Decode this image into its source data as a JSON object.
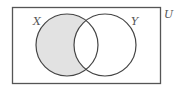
{
  "diagram": {
    "type": "venn",
    "universe_label": "U",
    "sets": [
      {
        "id": "X",
        "label": "X"
      },
      {
        "id": "Y",
        "label": "Y"
      }
    ],
    "shaded_region": "X minus Y (X only)",
    "colors": {
      "stroke": "#444444",
      "shade": "#e2e2e2",
      "background": "#ffffff"
    }
  }
}
